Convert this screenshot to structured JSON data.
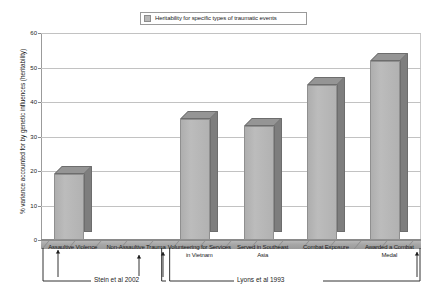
{
  "legend": {
    "label": "Heritability for specific types of traumatic events",
    "swatch_name": "series-swatch"
  },
  "axes": {
    "ylabel": "% variance accounted for by genetic influences (heritability)",
    "yticks": [
      "0",
      "10",
      "20",
      "30",
      "40",
      "50",
      "60"
    ]
  },
  "annotations": [
    {
      "label": "Stein et al 2002"
    },
    {
      "label": "Lyons et al 1993"
    }
  ],
  "chart_data": {
    "type": "bar",
    "title": "Heritability for specific types of traumatic events",
    "xlabel": "",
    "ylabel": "% variance accounted for by genetic influences (heritability)",
    "ylim": [
      0,
      60
    ],
    "ytick_step": 10,
    "grid": true,
    "legend_position": "top-center",
    "style": "3d-column",
    "bar_color": "#b2b2b2",
    "bar_side_color": "#7e7e7e",
    "bar_top_color": "#959595",
    "categories": [
      "Assaultive Violence",
      "Non-Assaultive Trauma",
      "Volunteering for Services in Vietnam",
      "Served in Southeast Asia",
      "Combat Exposure",
      "Awarded a Combat Medal"
    ],
    "values": [
      19,
      0,
      35,
      33,
      45,
      52
    ],
    "series": [
      {
        "name": "Heritability for specific types of traumatic events",
        "values": [
          19,
          0,
          35,
          33,
          45,
          52
        ]
      }
    ],
    "group_annotations": [
      {
        "label": "Stein et al 2002",
        "categories": [
          "Assaultive Violence",
          "Non-Assaultive Trauma"
        ]
      },
      {
        "label": "Lyons et al 1993",
        "categories": [
          "Volunteering for Services in Vietnam",
          "Served in Southeast Asia",
          "Combat Exposure",
          "Awarded a Combat Medal"
        ]
      }
    ]
  }
}
